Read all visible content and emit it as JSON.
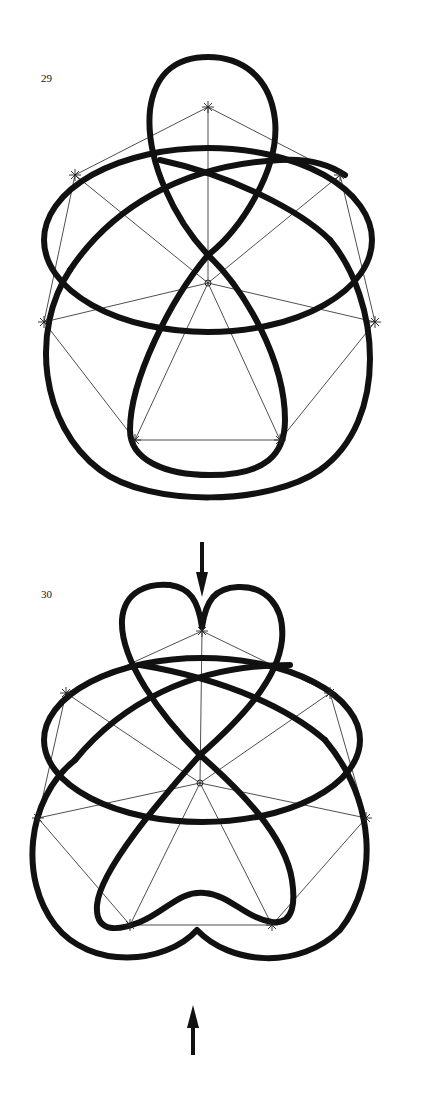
{
  "figures": [
    {
      "label": "29",
      "description": "Knot drawn over a heptagonal guide polygon with radial spokes from center; top loop is a round lobe, bottom closed by a round lobe",
      "center": [
        208,
        283
      ],
      "vertices": [
        [
          208,
          107
        ],
        [
          340,
          175
        ],
        [
          375,
          322
        ],
        [
          280,
          440
        ],
        [
          135,
          440
        ],
        [
          44,
          322
        ],
        [
          75,
          175
        ]
      ]
    },
    {
      "label": "30",
      "description": "Same knot modified: top lobe pinched into a heart shape and bottom lobe pinched into a cusp, indicated by arrows",
      "center": [
        200,
        783
      ],
      "vertices": [
        [
          202,
          631
        ],
        [
          330,
          693
        ],
        [
          366,
          818
        ],
        [
          272,
          925
        ],
        [
          130,
          925
        ],
        [
          38,
          818
        ],
        [
          66,
          693
        ]
      ],
      "arrows": [
        {
          "direction": "down",
          "x": 202,
          "y1": 540,
          "y2": 595
        },
        {
          "direction": "up",
          "x": 192,
          "y1": 1055,
          "y2": 1005
        }
      ]
    }
  ],
  "colors": {
    "ink": "#111111",
    "background": "#ffffff"
  }
}
